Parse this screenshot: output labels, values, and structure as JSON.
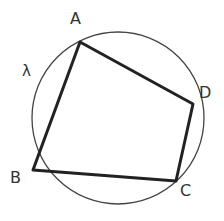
{
  "diagram": {
    "type": "cyclic-quadrilateral",
    "circle": {
      "label": "λ",
      "cx": 118,
      "cy": 118,
      "r": 86,
      "color": "#444444"
    },
    "points": [
      {
        "name": "A",
        "x": 80,
        "y": 42,
        "label_x": 70,
        "label_y": 24
      },
      {
        "name": "D",
        "x": 193,
        "y": 104,
        "label_x": 198,
        "label_y": 96
      },
      {
        "name": "C",
        "x": 176,
        "y": 181,
        "label_x": 180,
        "label_y": 196
      },
      {
        "name": "B",
        "x": 33,
        "y": 170,
        "label_x": 10,
        "label_y": 183
      }
    ],
    "polygon_color": "#222222",
    "circle_label": {
      "text": "λ",
      "x": 22,
      "y": 74
    }
  }
}
